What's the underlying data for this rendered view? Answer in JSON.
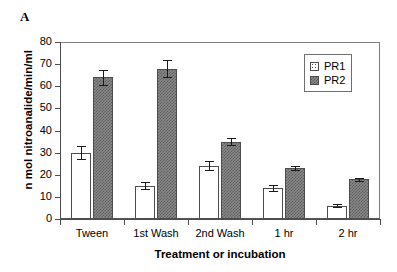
{
  "panel": {
    "letter": "A"
  },
  "chart_data": {
    "type": "bar",
    "title": "",
    "xlabel": "Treatment or incubation",
    "ylabel": "n mol nitroanalide/min/ml",
    "ylim": [
      0,
      80
    ],
    "ytick_step": 10,
    "yticks": [
      80,
      70,
      60,
      50,
      40,
      30,
      20,
      10,
      0
    ],
    "grid": false,
    "legend_position": "top-right",
    "categories": [
      "Tween",
      "1st Wash",
      "2nd Wash",
      "1 hr",
      "2 hr"
    ],
    "series": [
      {
        "name": "PR1",
        "fill": "white-dotted",
        "color": "#ffffff",
        "values": [
          30,
          15,
          24,
          14,
          6
        ],
        "errors": [
          3,
          1.5,
          2,
          1.5,
          0.7
        ]
      },
      {
        "name": "PR2",
        "fill": "gray-checkered",
        "color": "#8a8a8a",
        "values": [
          64,
          68,
          35,
          23,
          18
        ],
        "errors": [
          3.5,
          4,
          1.5,
          1,
          0.7
        ]
      }
    ]
  },
  "legend": {
    "entries": [
      {
        "label": "PR1"
      },
      {
        "label": "PR2"
      }
    ]
  }
}
